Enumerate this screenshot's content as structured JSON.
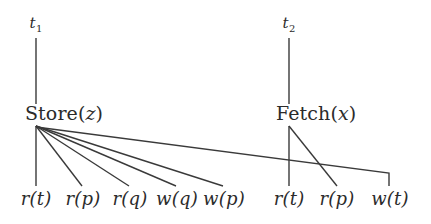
{
  "figure": {
    "kind": "transaction-operation-tree",
    "background_color": "#ffffff",
    "line_color": "#3a3a3a",
    "text_color": "#2b2b2b",
    "width": 431,
    "height": 224
  },
  "transactions": [
    {
      "id": "t1",
      "label_base": "t",
      "label_sub": "1",
      "label_x": 36,
      "label_y": 16,
      "stem": {
        "x": 36,
        "y1": 38,
        "y2": 104
      }
    },
    {
      "id": "t2",
      "label_base": "t",
      "label_sub": "2",
      "label_x": 289,
      "label_y": 16,
      "stem": {
        "x": 289,
        "y1": 38,
        "y2": 104
      }
    }
  ],
  "operations": [
    {
      "id": "store",
      "name": "Store",
      "arg": "z",
      "label": "Store(z)",
      "label_x": 25,
      "label_y": 104,
      "fan_origin": {
        "x": 36,
        "y": 126
      }
    },
    {
      "id": "fetch",
      "name": "Fetch",
      "arg": "x",
      "label": "Fetch(x)",
      "label_x": 276,
      "label_y": 104,
      "fan_origin": {
        "x": 289,
        "y": 126
      }
    }
  ],
  "leaves": [
    {
      "id": "leaf-1",
      "op": "r",
      "arg": "t",
      "label": "r(t)",
      "x": 36,
      "y": 190,
      "parent": "store"
    },
    {
      "id": "leaf-2",
      "op": "r",
      "arg": "p",
      "label": "r(p)",
      "x": 83,
      "y": 190,
      "parent": "store"
    },
    {
      "id": "leaf-3",
      "op": "r",
      "arg": "q",
      "label": "r(q)",
      "x": 130,
      "y": 190,
      "parent": "store"
    },
    {
      "id": "leaf-4",
      "op": "w",
      "arg": "q",
      "label": "w(q)",
      "x": 177,
      "y": 190,
      "parent": "store"
    },
    {
      "id": "leaf-5",
      "op": "w",
      "arg": "p",
      "label": "w(p)",
      "x": 224,
      "y": 190,
      "parent": "store"
    },
    {
      "id": "leaf-6",
      "op": "r",
      "arg": "t",
      "label": "r(t)",
      "x": 289,
      "y": 190,
      "parent": "fetch"
    },
    {
      "id": "leaf-7",
      "op": "r",
      "arg": "p",
      "label": "r(p)",
      "x": 337,
      "y": 190,
      "parent": "fetch"
    },
    {
      "id": "leaf-8",
      "op": "w",
      "arg": "t",
      "label": "w(t)",
      "x": 390,
      "y": 190,
      "parent": "store"
    }
  ],
  "edges": {
    "store_fan": [
      {
        "to": "leaf-1",
        "x1": 36,
        "y1": 126,
        "x2": 36,
        "y2": 186
      },
      {
        "to": "leaf-2",
        "x1": 36,
        "y1": 126,
        "x2": 82,
        "y2": 186
      },
      {
        "to": "leaf-3",
        "x1": 36,
        "y1": 126,
        "x2": 129,
        "y2": 186
      },
      {
        "to": "leaf-4",
        "x1": 36,
        "y1": 126,
        "x2": 176,
        "y2": 186
      },
      {
        "to": "leaf-5",
        "x1": 36,
        "y1": 126,
        "x2": 223,
        "y2": 186
      }
    ],
    "store_to_wt_elbow": {
      "x1": 36,
      "y1": 127,
      "x2": 389,
      "y2": 173,
      "x3": 389,
      "y3": 186
    },
    "fetch_fan": [
      {
        "to": "leaf-6",
        "x1": 289,
        "y1": 126,
        "x2": 289,
        "y2": 186
      },
      {
        "to": "leaf-7",
        "x1": 289,
        "y1": 126,
        "x2": 337,
        "y2": 186
      }
    ]
  }
}
